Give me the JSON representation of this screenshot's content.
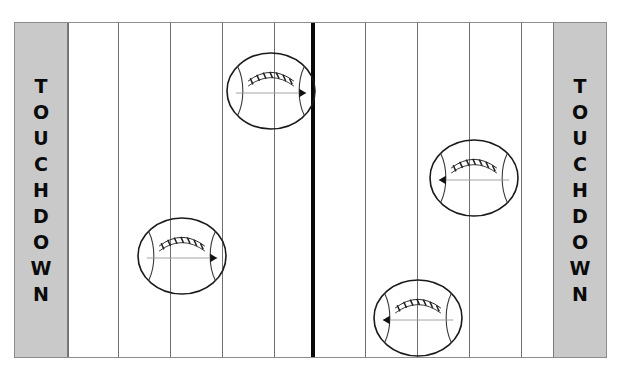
{
  "page": {
    "background_color": "#ffffff"
  },
  "field": {
    "x": 14,
    "y": 22,
    "width": 593,
    "height": 336,
    "surface_color": "#ffffff",
    "border_color": "#8c8c8c",
    "endzone_color": "#c9c9c9",
    "yardline_color": "#6f6f6f",
    "midline_color": "#080808"
  },
  "endzones": [
    {
      "side": "left",
      "label": "TOUCHDOWN",
      "letters": [
        "T",
        "O",
        "U",
        "C",
        "H",
        "D",
        "O",
        "W",
        "N"
      ]
    },
    {
      "side": "right",
      "label": "TOUCHDOWN",
      "letters": [
        "T",
        "O",
        "U",
        "C",
        "H",
        "D",
        "O",
        "W",
        "N"
      ]
    }
  ],
  "yard_lines": {
    "count": 10,
    "positions": [
      53,
      103,
      155,
      207,
      259,
      298,
      350,
      402,
      454,
      506,
      540
    ]
  },
  "midline": {
    "position": 296,
    "thickness": 4
  },
  "footballs": [
    {
      "id": "ball-top-left",
      "name": "football-top-left",
      "cx": 256,
      "cy": 68,
      "rx": 44,
      "ry": 38,
      "direction": "right",
      "direction_symbol": "▶",
      "laces": 7
    },
    {
      "id": "ball-mid-left",
      "name": "football-mid-left",
      "cx": 167,
      "cy": 233,
      "rx": 44,
      "ry": 38,
      "direction": "right",
      "direction_symbol": "▶",
      "laces": 7
    },
    {
      "id": "ball-mid-right",
      "name": "football-mid-right",
      "cx": 459,
      "cy": 155,
      "rx": 44,
      "ry": 38,
      "direction": "left",
      "direction_symbol": "◀",
      "laces": 7
    },
    {
      "id": "ball-bottom-right",
      "name": "football-bottom-right",
      "cx": 403,
      "cy": 295,
      "rx": 44,
      "ry": 38,
      "direction": "left",
      "direction_symbol": "◀",
      "laces": 7
    }
  ]
}
